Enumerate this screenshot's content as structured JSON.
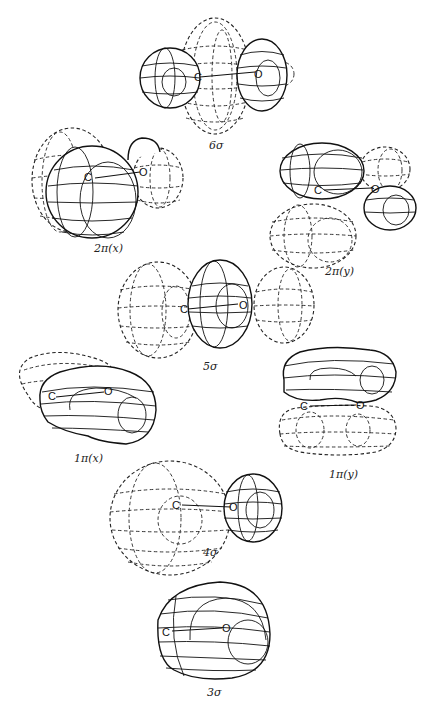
{
  "figure": {
    "type": "molecular orbital diagram",
    "molecule": "CO",
    "atoms": {
      "carbon": "C",
      "oxygen": "O"
    },
    "orbitals": [
      {
        "id": "6sigma",
        "label": "6σ"
      },
      {
        "id": "2pi_x",
        "label": "2π(x)"
      },
      {
        "id": "2pi_y",
        "label": "2π(y)"
      },
      {
        "id": "5sigma",
        "label": "5σ"
      },
      {
        "id": "1pi_x",
        "label": "1π(x)"
      },
      {
        "id": "1pi_y",
        "label": "1π(y)"
      },
      {
        "id": "4sigma",
        "label": "4σ"
      },
      {
        "id": "3sigma",
        "label": "3σ"
      }
    ],
    "legend": {
      "solid_lobes": "positive phase",
      "dashed_lobes": "negative phase"
    }
  }
}
